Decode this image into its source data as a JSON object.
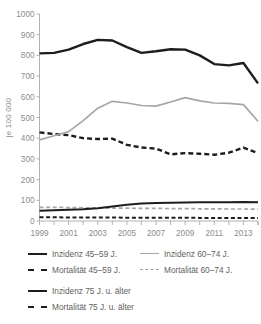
{
  "chart_data": {
    "type": "line",
    "title": "",
    "xlabel": "",
    "ylabel": "je 100 000",
    "ylim": [
      0,
      1000
    ],
    "xlim": [
      1999,
      2014
    ],
    "yticks": [
      0,
      100,
      200,
      300,
      400,
      500,
      600,
      700,
      800,
      900,
      1000
    ],
    "ytick_labels": [
      "0",
      "100",
      "200",
      "300",
      "400",
      "500",
      "600",
      "700",
      "800",
      "900",
      "1000"
    ],
    "x": [
      1999,
      2000,
      2001,
      2002,
      2003,
      2004,
      2005,
      2006,
      2007,
      2008,
      2009,
      2010,
      2011,
      2012,
      2013,
      2014
    ],
    "xtick_all": [
      1999,
      2000,
      2001,
      2002,
      2003,
      2004,
      2005,
      2006,
      2007,
      2008,
      2009,
      2010,
      2011,
      2012,
      2013,
      2014
    ],
    "xtick_labeled": [
      1999,
      2001,
      2003,
      2005,
      2007,
      2009,
      2011,
      2013
    ],
    "xtick_labels": [
      "1999",
      "2001",
      "2003",
      "2005",
      "2007",
      "2009",
      "2011",
      "2013"
    ],
    "grid": false,
    "legend_position": "below",
    "series": [
      {
        "name": "Inzidenz 75 J. u. älter",
        "color": "#1d1d1d",
        "style": "solid",
        "width": 2.4,
        "values": [
          810,
          812,
          828,
          855,
          875,
          872,
          840,
          812,
          820,
          830,
          828,
          800,
          758,
          752,
          763,
          665
        ]
      },
      {
        "name": "Mortalität 75 J. u. älter",
        "color": "#1d1d1d",
        "style": "dashed",
        "width": 2.4,
        "values": [
          428,
          420,
          415,
          400,
          396,
          398,
          368,
          355,
          350,
          322,
          328,
          325,
          320,
          330,
          355,
          327
        ]
      },
      {
        "name": "Inzidenz 60–74 J.",
        "color": "#a6a6a6",
        "style": "solid",
        "width": 1.7,
        "values": [
          392,
          412,
          432,
          485,
          545,
          578,
          570,
          558,
          555,
          575,
          596,
          580,
          570,
          568,
          562,
          482
        ]
      },
      {
        "name": "Mortalität 60–74 J.",
        "color": "#a6a6a6",
        "style": "dashed",
        "width": 1.7,
        "values": [
          66,
          66,
          65,
          64,
          63,
          62,
          62,
          61,
          61,
          60,
          60,
          59,
          59,
          58,
          58,
          57
        ]
      },
      {
        "name": "Inzidenz 45–59 J.",
        "color": "#1d1d1d",
        "style": "solid",
        "width": 2.0,
        "values": [
          50,
          52,
          54,
          57,
          62,
          70,
          78,
          84,
          87,
          88,
          89,
          90,
          90,
          91,
          92,
          90
        ]
      },
      {
        "name": "Mortalität 45–59 J.",
        "color": "#1d1d1d",
        "style": "dashed",
        "width": 2.0,
        "values": [
          18,
          18,
          17,
          17,
          17,
          17,
          16,
          16,
          16,
          16,
          16,
          15,
          15,
          15,
          15,
          15
        ]
      }
    ]
  },
  "axis": {
    "y_label": "je 100 000"
  },
  "legend": {
    "top": [
      {
        "label": "Inzidenz 45–59 J.",
        "swatch": "sw-solid-black"
      },
      {
        "label": "Inzidenz 60–74 J.",
        "swatch": "sw-solid-gray"
      },
      {
        "label": "Mortalität 45–59 J.",
        "swatch": "sw-dash-black"
      },
      {
        "label": "Mortalität 60–74 J.",
        "swatch": "sw-dash-gray"
      }
    ],
    "bottom": [
      {
        "label": "Inzidenz 75 J. u. älter",
        "swatch": "sw-solid-black"
      },
      {
        "label": "Mortalität 75 J. u. älter",
        "swatch": "sw-dash-black"
      }
    ]
  },
  "colors": {
    "series_dark": "#1d1d1d",
    "series_light": "#a6a6a6",
    "axis": "#a8a8a8",
    "text": "#8c8c8c",
    "background": "#ffffff"
  }
}
